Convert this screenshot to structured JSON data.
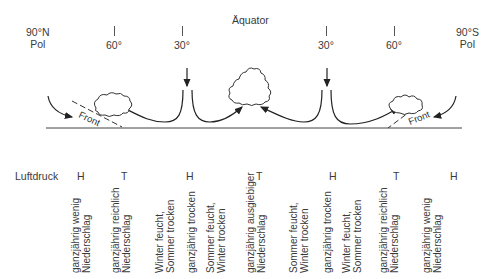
{
  "diagram": {
    "title": "Äquator",
    "poles": {
      "north": [
        "90°N",
        "Pol"
      ],
      "south": [
        "90°S",
        "Pol"
      ]
    },
    "latitudes": [
      "60°",
      "30°",
      "30°",
      "60°"
    ],
    "front_labels": [
      "Front",
      "Front"
    ],
    "pressure": {
      "label": "Luftdruck",
      "values": [
        "H",
        "T",
        "H",
        "T",
        "H",
        "T",
        "H"
      ]
    },
    "climate_zones": [
      [
        "ganzjährig wenig",
        "Niederschlag"
      ],
      [
        "ganzjährig reichlich",
        "Niederschlag"
      ],
      [
        "Winter feucht,",
        "Sommer trocken"
      ],
      [
        "ganzjährig trocken"
      ],
      [
        "Sommer feucht,",
        "Winter trocken"
      ],
      [
        "ganzjährig ausgiebiger",
        "Niederschlag"
      ],
      [
        "Sommer feucht,",
        "Winter trocken"
      ],
      [
        "ganzjährig trocken"
      ],
      [
        "Winter feucht,",
        "Sommer trocken"
      ],
      [
        "ganzjährig reichlich",
        "Niederschlag"
      ],
      [
        "ganzjährig wenig",
        "Niederschlag"
      ]
    ]
  }
}
